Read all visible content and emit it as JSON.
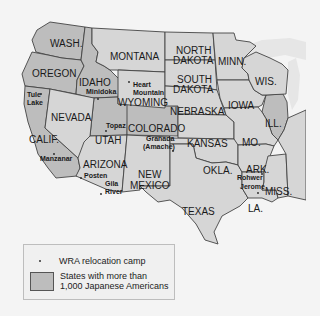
{
  "colors": {
    "background": "#f4f4f4",
    "shaded_state": "#bdbdbd",
    "other_state": "#d6d6d6",
    "lake": "#e6e6e6",
    "border": "#444444"
  },
  "states": {
    "wa": "WASH.",
    "or": "OREGON",
    "ca": "CALIF.",
    "id": "IDAHO",
    "nv": "NEVADA",
    "mt": "MONTANA",
    "wy": "WYOMING",
    "ut": "UTAH",
    "co": "COLORADO",
    "az": "ARIZONA",
    "nm_1": "NEW",
    "nm_2": "MEXICO",
    "nd_1": "NORTH",
    "nd_2": "DAKOTA",
    "sd_1": "SOUTH",
    "sd_2": "DAKOTA",
    "ne": "NEBRASKA",
    "ks": "KANSAS",
    "ok": "OKLA.",
    "tx": "TEXAS",
    "mn": "MINN.",
    "ia": "IOWA",
    "mo": "MO.",
    "ar": "ARK.",
    "la": "LA.",
    "wi": "WIS.",
    "il": "ILL.",
    "ms": "MISS."
  },
  "shaded_states": [
    "WASH.",
    "OREGON",
    "CALIF.",
    "IDAHO",
    "UTAH",
    "COLORADO",
    "ILL."
  ],
  "camps": {
    "tule_1": "Tule",
    "tule_2": "Lake",
    "minidoka": "Minidoka",
    "heart_1": "Heart",
    "heart_2": "Mountain",
    "manzanar": "Manzanar",
    "topaz": "Topaz",
    "granada_1": "Granada",
    "granada_2": "(Amache)",
    "poston": "Posten",
    "gila_1": "Gila",
    "gila_2": "River",
    "rohwer": "Rohwer",
    "jerome": "Jerome"
  },
  "legend": {
    "camp_label": "WRA relocation camp",
    "shaded_label_1": "States with more than",
    "shaded_label_2": "1,000 Japanese Americans"
  }
}
